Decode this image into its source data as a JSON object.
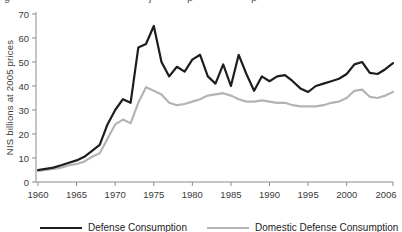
{
  "page": {
    "top_cropped_text_fragments": [
      {
        "x": 4,
        "glyph": "g"
      },
      {
        "x": 149,
        "glyph": "j"
      },
      {
        "x": 187,
        "glyph": "p"
      },
      {
        "x": 251,
        "glyph": "p"
      }
    ]
  },
  "chart_data": {
    "type": "line",
    "title": "",
    "xlabel": "",
    "ylabel": "NIS billions at 2005 prices",
    "ylim": [
      0,
      70
    ],
    "xlim": [
      1960,
      2006
    ],
    "grid": false,
    "legend_position": "bottom",
    "y_ticks": [
      0,
      10,
      20,
      30,
      40,
      50,
      60,
      70
    ],
    "x_tick_labels": [
      1960,
      1965,
      1970,
      1975,
      1980,
      1985,
      1990,
      1995,
      2000,
      2006
    ],
    "x": [
      1960,
      1961,
      1962,
      1963,
      1964,
      1965,
      1966,
      1967,
      1968,
      1969,
      1970,
      1971,
      1972,
      1973,
      1974,
      1975,
      1976,
      1977,
      1978,
      1979,
      1980,
      1981,
      1982,
      1983,
      1984,
      1985,
      1986,
      1987,
      1988,
      1989,
      1990,
      1991,
      1992,
      1993,
      1994,
      1995,
      1996,
      1997,
      1998,
      1999,
      2000,
      2001,
      2002,
      2003,
      2004,
      2005,
      2006
    ],
    "series": [
      {
        "name": "Defense Consumption",
        "color": "#1d1d1d",
        "values": [
          5,
          5.5,
          6,
          7,
          8,
          9,
          10.5,
          13,
          15.5,
          24,
          30,
          34.5,
          33,
          56,
          57.5,
          65,
          50,
          44,
          48,
          46,
          51,
          53,
          44,
          41,
          49,
          40,
          53,
          45,
          38,
          44,
          42,
          44,
          44.5,
          42,
          39,
          37.5,
          40,
          41,
          42,
          43,
          45,
          49,
          50,
          45.5,
          45,
          47,
          49.5
        ]
      },
      {
        "name": "Domestic Defense Consumption",
        "color": "#b4b4b4",
        "values": [
          4.5,
          5,
          5.5,
          6,
          7,
          7.5,
          8.5,
          10.5,
          12,
          18,
          24,
          26,
          24.5,
          33,
          39.5,
          38,
          36.5,
          33,
          32,
          32.5,
          33.5,
          34.5,
          36,
          36.5,
          37,
          36,
          34.5,
          33.5,
          33.5,
          34,
          33.5,
          33,
          33,
          32,
          31.5,
          31.5,
          31.5,
          32,
          33,
          33.5,
          35,
          38,
          38.5,
          35.5,
          35,
          36,
          37.5
        ]
      }
    ],
    "axis_color": "#8a8a8a"
  }
}
